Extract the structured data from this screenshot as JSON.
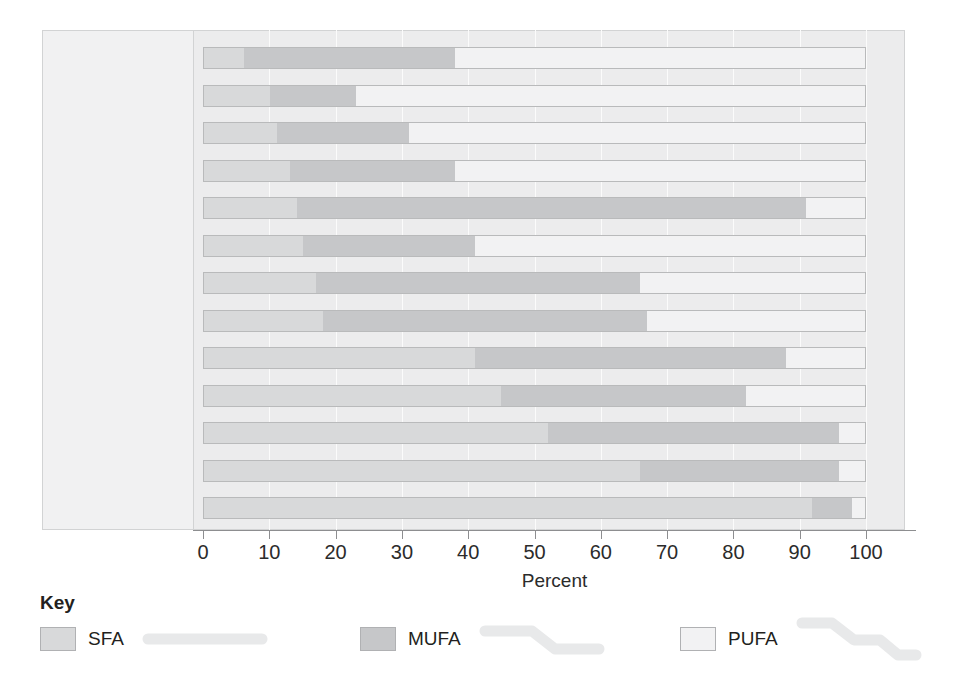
{
  "chart_data": {
    "type": "bar",
    "orientation": "horizontal",
    "stacked": true,
    "title": "",
    "xlabel": "Percent",
    "ylabel": "",
    "xlim": [
      0,
      100
    ],
    "xticks": [
      0,
      10,
      20,
      30,
      40,
      50,
      60,
      70,
      80,
      90,
      100
    ],
    "grid": true,
    "legend_position": "bottom",
    "categories": [
      "Canola oil",
      "Safflower oil",
      "Sunflower oil",
      "Corn oil",
      "Olive oil",
      "Soybean oil",
      "Margarine",
      "Peanut oil",
      "Pork fat",
      "Palm oil",
      "Beef fat",
      "Butter",
      "Coconut oil"
    ],
    "series": [
      {
        "name": "SFA",
        "color": "#d8d9da",
        "values": [
          6,
          10,
          11,
          13,
          14,
          15,
          17,
          18,
          41,
          45,
          52,
          66,
          92
        ]
      },
      {
        "name": "MUFA",
        "color": "#c6c7c9",
        "values": [
          32,
          13,
          20,
          25,
          77,
          26,
          49,
          49,
          47,
          37,
          44,
          30,
          6
        ]
      },
      {
        "name": "PUFA",
        "color": "#f2f2f3",
        "values": [
          62,
          77,
          69,
          62,
          9,
          59,
          34,
          33,
          12,
          18,
          4,
          4,
          2
        ]
      }
    ],
    "cumulative_boundaries": [
      {
        "category": "Canola oil",
        "sfa_end": 6,
        "mufa_end": 38,
        "total": 100
      },
      {
        "category": "Safflower oil",
        "sfa_end": 10,
        "mufa_end": 23,
        "total": 100
      },
      {
        "category": "Sunflower oil",
        "sfa_end": 11,
        "mufa_end": 31,
        "total": 100
      },
      {
        "category": "Corn oil",
        "sfa_end": 13,
        "mufa_end": 38,
        "total": 100
      },
      {
        "category": "Olive oil",
        "sfa_end": 14,
        "mufa_end": 91,
        "total": 100
      },
      {
        "category": "Soybean oil",
        "sfa_end": 15,
        "mufa_end": 41,
        "total": 100
      },
      {
        "category": "Margarine",
        "sfa_end": 17,
        "mufa_end": 66,
        "total": 100
      },
      {
        "category": "Peanut oil",
        "sfa_end": 18,
        "mufa_end": 67,
        "total": 100
      },
      {
        "category": "Pork fat",
        "sfa_end": 41,
        "mufa_end": 88,
        "total": 100
      },
      {
        "category": "Palm oil",
        "sfa_end": 45,
        "mufa_end": 82,
        "total": 100
      },
      {
        "category": "Beef fat",
        "sfa_end": 52,
        "mufa_end": 96,
        "total": 100
      },
      {
        "category": "Butter",
        "sfa_end": 66,
        "mufa_end": 96,
        "total": 100
      },
      {
        "category": "Coconut oil",
        "sfa_end": 92,
        "mufa_end": 98,
        "total": 100
      }
    ]
  },
  "axis": {
    "title": "Percent",
    "tick_labels": [
      "0",
      "10",
      "20",
      "30",
      "40",
      "50",
      "60",
      "70",
      "80",
      "90",
      "100"
    ]
  },
  "key": {
    "title": "Key",
    "entries": [
      {
        "label": "SFA",
        "swatch_color": "#d8d9da",
        "glyph": "straight-chain-icon"
      },
      {
        "label": "MUFA",
        "swatch_color": "#c6c7c9",
        "glyph": "single-kink-chain-icon"
      },
      {
        "label": "PUFA",
        "swatch_color": "#f2f2f3",
        "glyph": "double-kink-chain-icon"
      }
    ]
  },
  "colors": {
    "sfa": "#d8d9da",
    "mufa": "#c6c7c9",
    "pufa": "#f2f2f3",
    "panel_background": "#ececed",
    "label_panel_background": "#f1f1f2",
    "bar_border": "#b9babb",
    "axis": "#8d8e90",
    "text": "#231f20",
    "glyph": "#e8e9ea"
  }
}
